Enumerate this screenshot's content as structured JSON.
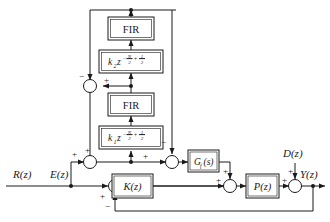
{
  "diagram": {
    "type": "block-diagram",
    "canvas": {
      "width": 330,
      "height": 222
    },
    "colors": {
      "line": "#1a1a1a",
      "background": "#ffffff",
      "box_fill": "#ffffff"
    },
    "blocks": [
      {
        "id": "fir_top",
        "label": "FIR",
        "style": "upright"
      },
      {
        "id": "k2",
        "label_base": "k",
        "label_sub": "2",
        "label_var": "z",
        "exponent": "-N/2 + 1/2",
        "exp_num1": "N",
        "exp_den1": "2",
        "exp_num2": "1",
        "exp_den2": "2",
        "exp_sign1": "−",
        "exp_sign2": "+"
      },
      {
        "id": "fir_bot",
        "label": "FIR",
        "style": "upright"
      },
      {
        "id": "k1",
        "label_base": "k",
        "label_sub": "1",
        "label_var": "z",
        "exponent": "-N/2 + 1/2",
        "exp_num1": "N",
        "exp_den1": "2",
        "exp_num2": "1",
        "exp_den2": "2",
        "exp_sign1": "−",
        "exp_sign2": "+"
      },
      {
        "id": "gf",
        "label": "G",
        "label_sub": "f",
        "label_arg": "(s)"
      },
      {
        "id": "kz",
        "label": "K",
        "label_arg": "(z)"
      },
      {
        "id": "pz",
        "label": "P",
        "label_arg": "(z)"
      }
    ],
    "signals": {
      "input": "R(z)",
      "error": "E(z)",
      "disturbance": "D(z)",
      "output": "Y(z)"
    },
    "signs": {
      "sum_main_input": "+",
      "sum_main_feedback": "−",
      "sum_inner_left_minus": "−",
      "sum_inner_right_plus": "+",
      "sum_lower_plus_a": "+",
      "sum_lower_plus_b": "+",
      "sum_lower_plus_c": "+",
      "sum_gf_minus": "−",
      "sum_plant_plus_left": "+",
      "sum_plant_plus_top": "+",
      "sum_out_plus_left": "+",
      "sum_out_plus_dist": "+"
    }
  }
}
